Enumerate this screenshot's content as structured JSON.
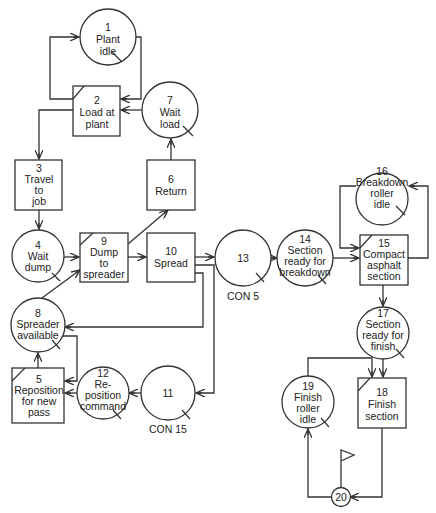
{
  "diagram": {
    "type": "CYCLONE network - asphalt paving operation",
    "nodes": {
      "n1": {
        "id": "1",
        "kind": "queue",
        "lines": [
          "1",
          "Plant",
          "idle"
        ]
      },
      "n2": {
        "id": "2",
        "kind": "combi",
        "lines": [
          "2",
          "Load at",
          "plant"
        ]
      },
      "n3": {
        "id": "3",
        "kind": "normal",
        "lines": [
          "3",
          "Travel",
          "to",
          "job"
        ]
      },
      "n4": {
        "id": "4",
        "kind": "queue",
        "lines": [
          "4",
          "Wait",
          "dump"
        ]
      },
      "n5": {
        "id": "5",
        "kind": "combi",
        "lines": [
          "5",
          "Reposition",
          "for new",
          "pass"
        ]
      },
      "n6": {
        "id": "6",
        "kind": "normal",
        "lines": [
          "6",
          "Return"
        ]
      },
      "n7": {
        "id": "7",
        "kind": "queue",
        "lines": [
          "7",
          "Wait",
          "load"
        ]
      },
      "n8": {
        "id": "8",
        "kind": "queue",
        "lines": [
          "8",
          "Spreader",
          "available"
        ]
      },
      "n9": {
        "id": "9",
        "kind": "combi",
        "lines": [
          "9",
          "Dump",
          "to",
          "spreader"
        ]
      },
      "n10": {
        "id": "10",
        "kind": "normal",
        "lines": [
          "10",
          "Spread"
        ]
      },
      "n11": {
        "id": "11",
        "kind": "queue",
        "lines": [
          "11"
        ],
        "caption": "CON 15"
      },
      "n12": {
        "id": "12",
        "kind": "queue",
        "lines": [
          "12",
          "Re-",
          "position",
          "command"
        ]
      },
      "n13": {
        "id": "13",
        "kind": "queue",
        "lines": [
          "13"
        ],
        "caption": "CON 5"
      },
      "n14": {
        "id": "14",
        "kind": "queue",
        "lines": [
          "14",
          "Section",
          "ready for",
          "breakdown"
        ]
      },
      "n15": {
        "id": "15",
        "kind": "combi",
        "lines": [
          "15",
          "Compact",
          "asphalt",
          "section"
        ]
      },
      "n16": {
        "id": "16",
        "kind": "queue",
        "lines": [
          "16",
          "Breakdown",
          "roller",
          "idle"
        ]
      },
      "n17": {
        "id": "17",
        "kind": "queue",
        "lines": [
          "17",
          "Section",
          "ready for",
          "finish"
        ]
      },
      "n18": {
        "id": "18",
        "kind": "combi",
        "lines": [
          "18",
          "Finish",
          "section"
        ]
      },
      "n19": {
        "id": "19",
        "kind": "queue",
        "lines": [
          "19",
          "Finish",
          "roller",
          "idle"
        ]
      },
      "n20": {
        "id": "20",
        "kind": "counter",
        "lines": [
          "20"
        ]
      }
    },
    "edges": [
      [
        "1",
        "2"
      ],
      [
        "2",
        "1"
      ],
      [
        "7",
        "2"
      ],
      [
        "2",
        "3"
      ],
      [
        "3",
        "4"
      ],
      [
        "4",
        "9"
      ],
      [
        "8",
        "9"
      ],
      [
        "9",
        "6"
      ],
      [
        "6",
        "7"
      ],
      [
        "9",
        "10"
      ],
      [
        "10",
        "13"
      ],
      [
        "10",
        "8"
      ],
      [
        "10",
        "11"
      ],
      [
        "11",
        "12"
      ],
      [
        "12",
        "5"
      ],
      [
        "8",
        "5"
      ],
      [
        "5",
        "8"
      ],
      [
        "13",
        "14"
      ],
      [
        "14",
        "15"
      ],
      [
        "16",
        "15"
      ],
      [
        "15",
        "16"
      ],
      [
        "15",
        "17"
      ],
      [
        "17",
        "18"
      ],
      [
        "19",
        "18"
      ],
      [
        "18",
        "20"
      ],
      [
        "20",
        "19"
      ]
    ],
    "colors": {
      "stroke": "#333333",
      "background": "#ffffff",
      "text": "#222222"
    }
  }
}
